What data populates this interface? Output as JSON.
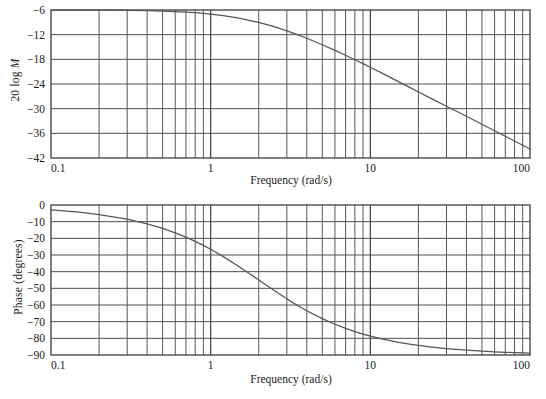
{
  "figure": {
    "kind": "bode-plot",
    "background": "#ffffff",
    "ink": "#4a4a4a",
    "text_color": "#1a1a1a"
  },
  "chart_data": [
    {
      "type": "line",
      "id": "magnitude",
      "title": "",
      "xlabel": "Frequency (rad/s)",
      "ylabel": "20 log M",
      "ylabel_parts": {
        "plain": "20 log ",
        "italic": "M"
      },
      "xscale": "log",
      "xlim": [
        0.1,
        100
      ],
      "ylim": [
        -42,
        -6
      ],
      "xticks": [
        0.1,
        1,
        10,
        100
      ],
      "xticklabels": [
        "0.1",
        "1",
        "10",
        "100"
      ],
      "yticks": [
        -6,
        -12,
        -18,
        -24,
        -30,
        -36,
        -42
      ],
      "yticklabels": [
        "−6",
        "−12",
        "−18",
        "−24",
        "−30",
        "−36",
        "−42"
      ],
      "grid": true,
      "grid_minor_log": [
        2,
        3,
        4,
        5,
        6,
        7,
        8,
        9
      ],
      "legend": null,
      "series": [
        {
          "name": "20 log M",
          "x": [
            0.1,
            0.15,
            0.2,
            0.3,
            0.4,
            0.5,
            0.6,
            0.7,
            0.8,
            0.9,
            1.0,
            1.2,
            1.5,
            1.8,
            2.0,
            2.5,
            3.0,
            3.5,
            4.0,
            5.0,
            6.0,
            7.0,
            8.0,
            9.0,
            10.0,
            12.0,
            15.0,
            18.0,
            20.0,
            25.0,
            30.0,
            40.0,
            50.0,
            60.0,
            70.0,
            80.0,
            90.0,
            100.0
          ],
          "y": [
            -6.01,
            -6.02,
            -6.04,
            -6.1,
            -6.17,
            -6.27,
            -6.38,
            -6.51,
            -6.65,
            -6.81,
            -6.99,
            -7.36,
            -7.97,
            -8.62,
            -9.03,
            -10.05,
            -11.06,
            -12.0,
            -12.88,
            -14.45,
            -15.82,
            -17.02,
            -18.09,
            -19.05,
            -19.93,
            -21.47,
            -23.41,
            -25.0,
            -25.93,
            -27.85,
            -29.4,
            -31.86,
            -33.78,
            -35.36,
            -36.7,
            -37.87,
            -38.9,
            -39.82
          ],
          "model": "20*log10(0.5/sqrt(1+(w/2)^2))",
          "dc_gain_db": -6,
          "corner_frequency_rad_s": 2,
          "slope_db_per_decade": -20,
          "value_at_100": -39.8
        }
      ]
    },
    {
      "type": "line",
      "id": "phase",
      "title": "",
      "xlabel": "Frequency (rad/s)",
      "ylabel": "Phase (degrees)",
      "xscale": "log",
      "xlim": [
        0.1,
        100
      ],
      "ylim": [
        -90,
        0
      ],
      "xticks": [
        0.1,
        1,
        10,
        100
      ],
      "xticklabels": [
        "0.1",
        "1",
        "10",
        "100"
      ],
      "yticks": [
        0,
        -10,
        -20,
        -30,
        -40,
        -50,
        -60,
        -70,
        -80,
        -90
      ],
      "yticklabels": [
        "0",
        "−10",
        "−20",
        "−30",
        "−40",
        "−50",
        "−60",
        "−70",
        "−80",
        "−90"
      ],
      "grid": true,
      "grid_minor_log": [
        2,
        3,
        4,
        5,
        6,
        7,
        8,
        9
      ],
      "legend": null,
      "series": [
        {
          "name": "Phase",
          "x": [
            0.1,
            0.15,
            0.2,
            0.3,
            0.4,
            0.5,
            0.6,
            0.7,
            0.8,
            0.9,
            1.0,
            1.2,
            1.5,
            1.8,
            2.0,
            2.5,
            3.0,
            3.5,
            4.0,
            5.0,
            6.0,
            7.0,
            8.0,
            9.0,
            10.0,
            12.0,
            15.0,
            18.0,
            20.0,
            25.0,
            30.0,
            40.0,
            50.0,
            60.0,
            70.0,
            80.0,
            90.0,
            100.0
          ],
          "y": [
            -2.86,
            -4.29,
            -5.71,
            -8.53,
            -11.31,
            -14.04,
            -16.7,
            -19.29,
            -21.8,
            -24.23,
            -26.57,
            -30.96,
            -36.87,
            -41.99,
            -45.0,
            -51.34,
            -56.31,
            -60.26,
            -63.43,
            -68.2,
            -71.57,
            -74.05,
            -75.96,
            -77.47,
            -78.69,
            -80.54,
            -82.41,
            -83.66,
            -84.29,
            -85.43,
            -86.19,
            -87.14,
            -87.71,
            -88.09,
            -88.36,
            -88.57,
            -88.73,
            -88.85
          ],
          "model": "-atan(w/2)",
          "corner_frequency_rad_s": 2,
          "phase_at_corner_deg": -45,
          "asymptote_low_deg": 0,
          "asymptote_high_deg": -90
        }
      ]
    }
  ]
}
